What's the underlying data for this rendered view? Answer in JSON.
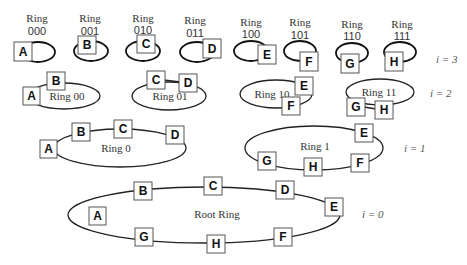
{
  "levels": [
    {
      "label": "i = 3",
      "var": "i",
      "value": "3"
    },
    {
      "label": "i = 2",
      "var": "i",
      "value": "2"
    },
    {
      "label": "i = 1",
      "var": "i",
      "value": "1"
    },
    {
      "label": "i = 0",
      "var": "i",
      "value": "0"
    }
  ],
  "level3": {
    "ring_word": "Ring",
    "rings": [
      {
        "code": "000",
        "node": "A"
      },
      {
        "code": "001",
        "node": "B"
      },
      {
        "code": "010",
        "node": "C"
      },
      {
        "code": "011",
        "node": "D"
      },
      {
        "code": "100",
        "node": "E"
      },
      {
        "code": "101",
        "node": "F"
      },
      {
        "code": "110",
        "node": "G"
      },
      {
        "code": "111",
        "node": "H"
      }
    ]
  },
  "level2": {
    "rings": [
      {
        "label": "Ring 00",
        "nodes": [
          "A",
          "B"
        ]
      },
      {
        "label": "Ring 01",
        "nodes": [
          "C",
          "D"
        ]
      },
      {
        "label": "Ring 10",
        "nodes": [
          "E",
          "F"
        ]
      },
      {
        "label": "Ring 11",
        "nodes": [
          "G",
          "H"
        ]
      }
    ]
  },
  "level1": {
    "rings": [
      {
        "label": "Ring 0",
        "nodes": [
          "A",
          "B",
          "C",
          "D"
        ]
      },
      {
        "label": "Ring 1",
        "nodes": [
          "E",
          "F",
          "G",
          "H"
        ]
      }
    ]
  },
  "level0": {
    "rings": [
      {
        "label": "Root Ring",
        "nodes": [
          "A",
          "B",
          "C",
          "D",
          "E",
          "F",
          "G",
          "H"
        ]
      }
    ]
  }
}
